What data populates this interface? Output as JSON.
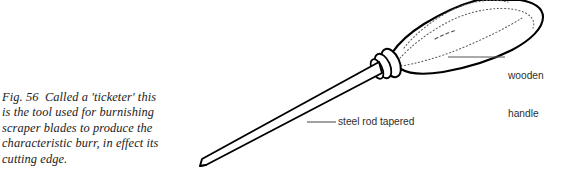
{
  "figure": {
    "number": "Fig. 56",
    "caption_lines": [
      "Fig. 56  Called a 'ticketer' this",
      "is the tool used for burnishing",
      "scraper blades to produce the",
      "characteristic burr, in effect its",
      "cutting edge."
    ],
    "caption_full": "Fig. 56  Called a 'ticketer' this is the tool used for burnishing scraper blades to produce the characteristic burr, in effect its cutting edge."
  },
  "callouts": [
    {
      "id": "wooden-handle",
      "line1": "wooden",
      "line2": "handle",
      "text": "wooden handle"
    },
    {
      "id": "steel-rod",
      "text": "steel rod tapered"
    }
  ],
  "illustration": {
    "subject": "ticketer burnishing tool",
    "parts": [
      "wooden handle",
      "ferrule rings",
      "tapered steel rod"
    ]
  },
  "colors": {
    "background": "#ffffff",
    "ink": "#000000",
    "caption_text": "#1b1b1b",
    "label_text": "#2e2e2e",
    "leader_line": "#555555",
    "grain_dots": "#6b6b6b"
  }
}
